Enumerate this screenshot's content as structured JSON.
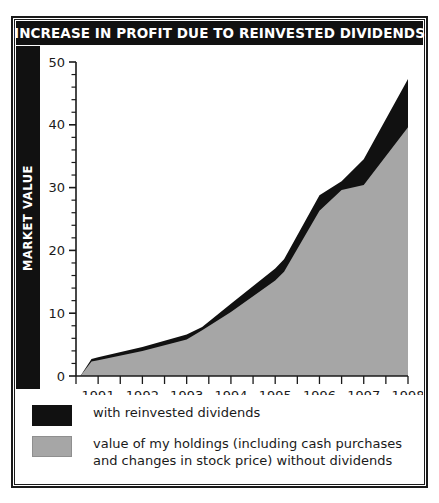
{
  "title": "INCREASE IN PROFIT DUE TO REINVESTED DIVIDENDS",
  "axis": {
    "y_label": "MARKET VALUE"
  },
  "legend": {
    "items": [
      {
        "key": "with-reinvested-dividends",
        "color": "#111111",
        "lines": [
          "with reinvested dividends"
        ]
      },
      {
        "key": "without-dividends",
        "color": "#a6a6a6",
        "lines": [
          "value of my holdings (including cash purchases",
          "and changes in stock price) without dividends"
        ]
      }
    ]
  },
  "chart_data": {
    "type": "area",
    "title": "INCREASE IN PROFIT DUE TO REINVESTED DIVIDENDS",
    "xlabel": "",
    "ylabel": "MARKET VALUE",
    "stacked": false,
    "grid": false,
    "legend_position": "below",
    "xlim": [
      1990.5,
      1998.0
    ],
    "ylim": [
      0,
      50
    ],
    "ytick_major_step": 10,
    "ytick_minor_step": 2,
    "ytick_labels": [
      "0",
      "10",
      "20",
      "30",
      "40",
      "50"
    ],
    "ytick_values": [
      0,
      10,
      20,
      30,
      40,
      50
    ],
    "xtick_labels": [
      "1991",
      "1992",
      "1993",
      "1994",
      "1995",
      "1996",
      "1997",
      "1998"
    ],
    "xtick_values": [
      1991,
      1992,
      1993,
      1994,
      1995,
      1996,
      1997,
      1998
    ],
    "xtick_minor_step": 0.5,
    "x": [
      1990.6,
      1990.85,
      1991,
      1992,
      1993,
      1993.35,
      1994,
      1995,
      1995.2,
      1996,
      1996.5,
      1997,
      1998
    ],
    "series": [
      {
        "name": "with reinvested dividends",
        "color": "#111111",
        "values": [
          0,
          2.7,
          3.0,
          4.6,
          6.6,
          7.8,
          11.5,
          17.1,
          18.6,
          28.8,
          31.0,
          34.5,
          47.3
        ]
      },
      {
        "name": "value of my holdings (including cash purchases and changes in stock price) without dividends",
        "color": "#a6a6a6",
        "values": [
          0,
          2.3,
          2.5,
          4.0,
          5.8,
          7.3,
          10.2,
          15.2,
          16.6,
          26.3,
          29.6,
          30.4,
          39.6
        ]
      }
    ]
  }
}
